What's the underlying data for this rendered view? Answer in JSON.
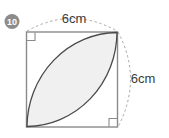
{
  "figure": {
    "question_number": "10",
    "shape_name": "square-with-lens",
    "background_color": "#ffffff",
    "square": {
      "stroke_color": "#8a8a8a",
      "side_length_label": "6cm"
    },
    "lens": {
      "fill_color": "#f0f0f0",
      "stroke_color": "#4a4a4a"
    },
    "dimension_arc": {
      "color": "#a8a8a8",
      "style": "dashed"
    },
    "labels": {
      "top": "6cm",
      "right": "6cm"
    },
    "marks": {
      "right_angle_count": 2,
      "color": "#8a8a8a"
    }
  }
}
